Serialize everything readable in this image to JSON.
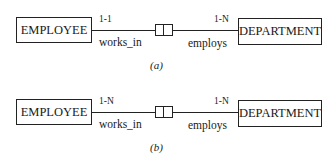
{
  "diagrams": [
    {
      "caption": "(a)",
      "left_entity": "EMPLOYEE",
      "right_entity": "DEPARTMENT",
      "left_cardinality": "1-1",
      "right_cardinality": "1-N",
      "left_role": "works_in",
      "right_role": "employs",
      "relationship_icon": "split-box-relationship-icon"
    },
    {
      "caption": "(b)",
      "left_entity": "EMPLOYEE",
      "right_entity": "DEPARTMENT",
      "left_cardinality": "1-N",
      "right_cardinality": "1-N",
      "left_role": "works_in",
      "right_role": "employs",
      "relationship_icon": "split-box-relationship-icon"
    }
  ]
}
